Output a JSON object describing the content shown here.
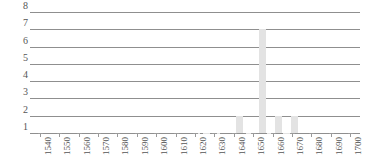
{
  "chart_data": {
    "type": "bar",
    "title": "",
    "xlabel": "",
    "ylabel": "",
    "grid": true,
    "legend": false,
    "ylim": [
      1,
      8
    ],
    "yticks": [
      1,
      2,
      3,
      4,
      5,
      6,
      7,
      8
    ],
    "xlim": [
      1535,
      1705
    ],
    "xticks": [
      1540,
      1550,
      1560,
      1570,
      1580,
      1590,
      1600,
      1610,
      1620,
      1630,
      1640,
      1650,
      1660,
      1670,
      1680,
      1690,
      1700
    ],
    "bar_color": "#e3e3e3",
    "grid_color": "#8f8f8f",
    "x": [
      1621,
      1626,
      1631,
      1643,
      1648,
      1655,
      1659,
      1663,
      1667,
      1671
    ],
    "values": [
      1,
      1,
      1,
      2,
      1,
      7,
      1,
      2,
      1,
      2
    ],
    "categories": [
      "1621",
      "1626",
      "1631",
      "1643",
      "1648",
      "1655",
      "1659",
      "1663",
      "1667",
      "1671"
    ]
  },
  "axis": {
    "ylabels": [
      "8",
      "7",
      "6",
      "5",
      "4",
      "3",
      "2",
      "1"
    ],
    "xlabels": [
      "1540",
      "1550",
      "1560",
      "1570",
      "1580",
      "1590",
      "1600",
      "1610",
      "1620",
      "1630",
      "1640",
      "1650",
      "1660",
      "1670",
      "1680",
      "1690",
      "1700"
    ]
  }
}
